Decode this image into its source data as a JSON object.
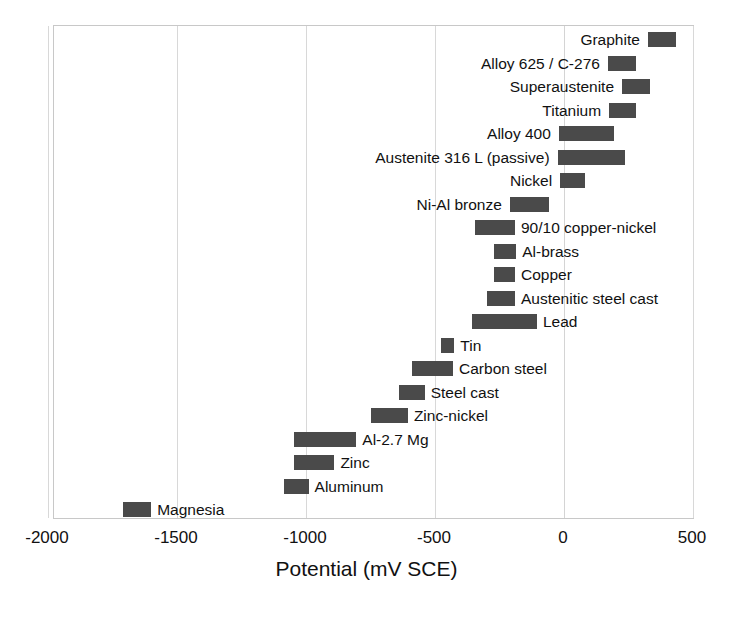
{
  "chart_data": {
    "type": "bar",
    "orientation": "horizontal",
    "title": "",
    "subtitle": "",
    "xlabel": "Potential (mV SCE)",
    "ylabel": "",
    "xlim": [
      -2150,
      620
    ],
    "xticks": [
      -2000,
      -1500,
      -1000,
      -500,
      0,
      500
    ],
    "xtick_labels": [
      "-2000",
      "-1500",
      "-1000",
      "-500",
      "0",
      "500"
    ],
    "grid": true,
    "grid_axis": "x",
    "legend": "none",
    "bar_color": "#4a4a4a",
    "value_type": "range",
    "units": "mV SCE",
    "categories": [
      "Graphite",
      "Alloy 625 / C-276",
      "Superaustenite",
      "Titanium",
      "Alloy 400",
      "Austenite 316 L (passive)",
      "Nickel",
      "Ni-Al bronze",
      "90/10 copper-nickel",
      "Al-brass",
      "Copper",
      "Austenitic steel cast",
      "Lead",
      "Tin",
      "Carbon steel",
      "Steel cast",
      "Zinc-nickel",
      "Al-2.7 Mg",
      "Zinc",
      "Aluminum",
      "Magnesia"
    ],
    "bars": [
      {
        "label": "Graphite",
        "start": 325,
        "end": 435,
        "label_side": "left"
      },
      {
        "label": "Alloy 625 / C-276",
        "start": 170,
        "end": 280,
        "label_side": "left"
      },
      {
        "label": "Superaustenite",
        "start": 225,
        "end": 335,
        "label_side": "left"
      },
      {
        "label": "Titanium",
        "start": 175,
        "end": 280,
        "label_side": "left"
      },
      {
        "label": "Alloy 400",
        "start": -20,
        "end": 195,
        "label_side": "left"
      },
      {
        "label": "Austenite 316 L (passive)",
        "start": -25,
        "end": 235,
        "label_side": "left"
      },
      {
        "label": "Nickel",
        "start": -15,
        "end": 80,
        "label_side": "left"
      },
      {
        "label": "Ni-Al bronze",
        "start": -210,
        "end": -60,
        "label_side": "left"
      },
      {
        "label": "90/10 copper-nickel",
        "start": -345,
        "end": -190,
        "label_side": "right"
      },
      {
        "label": "Al-brass",
        "start": -270,
        "end": -185,
        "label_side": "right"
      },
      {
        "label": "Copper",
        "start": -270,
        "end": -190,
        "label_side": "right"
      },
      {
        "label": "Austenitic steel cast",
        "start": -300,
        "end": -190,
        "label_side": "right"
      },
      {
        "label": "Lead",
        "start": -355,
        "end": -105,
        "label_side": "right"
      },
      {
        "label": "Tin",
        "start": -475,
        "end": -425,
        "label_side": "right"
      },
      {
        "label": "Carbon steel",
        "start": -590,
        "end": -430,
        "label_side": "right"
      },
      {
        "label": "Steel cast",
        "start": -640,
        "end": -540,
        "label_side": "right"
      },
      {
        "label": "Zinc-nickel",
        "start": -750,
        "end": -605,
        "label_side": "right"
      },
      {
        "label": "Al-2.7 Mg",
        "start": -1045,
        "end": -805,
        "label_side": "right"
      },
      {
        "label": "Zinc",
        "start": -1045,
        "end": -890,
        "label_side": "right"
      },
      {
        "label": "Aluminum",
        "start": -1085,
        "end": -990,
        "label_side": "right"
      },
      {
        "label": "Magnesia",
        "start": -1710,
        "end": -1600,
        "label_side": "right"
      }
    ]
  }
}
